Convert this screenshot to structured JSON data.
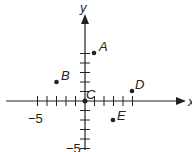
{
  "diagram": {
    "type": "coordinate-plane",
    "axes": {
      "x_label": "x",
      "y_label": "y",
      "x_tick_label_neg": "−5",
      "y_tick_label_neg": "−5",
      "x_range": [
        -6,
        5
      ],
      "y_range": [
        -5,
        6
      ]
    },
    "points": [
      {
        "name": "A",
        "x": 1,
        "y": 5
      },
      {
        "name": "B",
        "x": -3,
        "y": 2
      },
      {
        "name": "C",
        "x": 0,
        "y": 0
      },
      {
        "name": "D",
        "x": 5,
        "y": 1
      },
      {
        "name": "E",
        "x": 3,
        "y": -2
      }
    ],
    "colors": {
      "ink": "#222222",
      "background": "#ffffff"
    }
  }
}
